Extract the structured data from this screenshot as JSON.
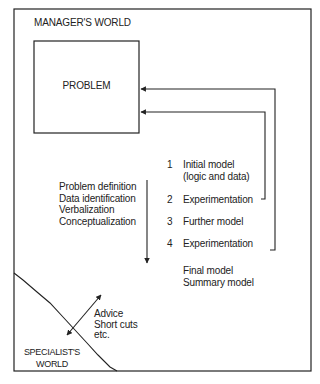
{
  "diagram": {
    "regions": {
      "manager_world": "MANAGER'S WORLD",
      "specialist_world": [
        "SPECIALIST'S",
        "WORLD"
      ]
    },
    "problem_box": {
      "label": "PROBLEM"
    },
    "manager_activities": [
      "Problem definition",
      "Data identification",
      "Verbalization",
      "Conceptualization"
    ],
    "steps": [
      {
        "number": "1",
        "lines": [
          "Initial model",
          "(logic and data)"
        ]
      },
      {
        "number": "2",
        "lines": [
          "Experimentation"
        ]
      },
      {
        "number": "3",
        "lines": [
          "Further model"
        ]
      },
      {
        "number": "4",
        "lines": [
          "Experimentation"
        ]
      }
    ],
    "final_outputs": [
      "Final model",
      "Summary model"
    ],
    "specialist_inputs": [
      "Advice",
      "Short cuts",
      "etc."
    ],
    "feedback_arrows": [
      {
        "from": "step 2 Experimentation",
        "to": "PROBLEM"
      },
      {
        "from": "step 4 Experimentation",
        "to": "PROBLEM"
      }
    ],
    "colors": {
      "line": "#222222",
      "text": "#222222",
      "background": "#ffffff"
    }
  }
}
